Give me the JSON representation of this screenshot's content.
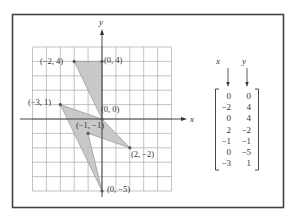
{
  "figure": {
    "axis_labels": {
      "x": "x",
      "y": "y"
    },
    "grid_range": {
      "x": [
        -5,
        5
      ],
      "y": [
        -5,
        5
      ]
    },
    "polygon_vertices": [
      {
        "x": 0,
        "y": 0,
        "label": "(0, 0)"
      },
      {
        "x": -2,
        "y": 4,
        "label": "(−2, 4)"
      },
      {
        "x": 0,
        "y": 4,
        "label": "(0, 4)"
      },
      {
        "x": 2,
        "y": -2,
        "label": "(2, −2)"
      },
      {
        "x": -1,
        "y": -1,
        "label": "(−1, −1)"
      },
      {
        "x": 0,
        "y": -5,
        "label": "(0, −5)"
      },
      {
        "x": -3,
        "y": 1,
        "label": "(−3, 1)"
      }
    ],
    "shapes": [
      {
        "name": "upper-quadrilateral",
        "vertices": [
          [
            -2,
            4
          ],
          [
            0,
            4
          ],
          [
            0,
            0
          ]
        ]
      },
      {
        "name": "lightning-bolt",
        "vertices": [
          [
            -3,
            1
          ],
          [
            0,
            0
          ],
          [
            2,
            -2
          ],
          [
            -1,
            -1
          ],
          [
            0,
            -5
          ]
        ]
      }
    ],
    "colors": {
      "fill": "#c4c4c4",
      "grid": "#9a9a9a",
      "frame": "#444444",
      "ink": "#333333"
    }
  },
  "matrix": {
    "column_headers": [
      "x",
      "y"
    ],
    "rows": [
      [
        "0",
        "0"
      ],
      [
        "−2",
        "4"
      ],
      [
        "0",
        "4"
      ],
      [
        "2",
        "−2"
      ],
      [
        "−1",
        "−1"
      ],
      [
        "0",
        "−5"
      ],
      [
        "−3",
        "1"
      ]
    ]
  }
}
